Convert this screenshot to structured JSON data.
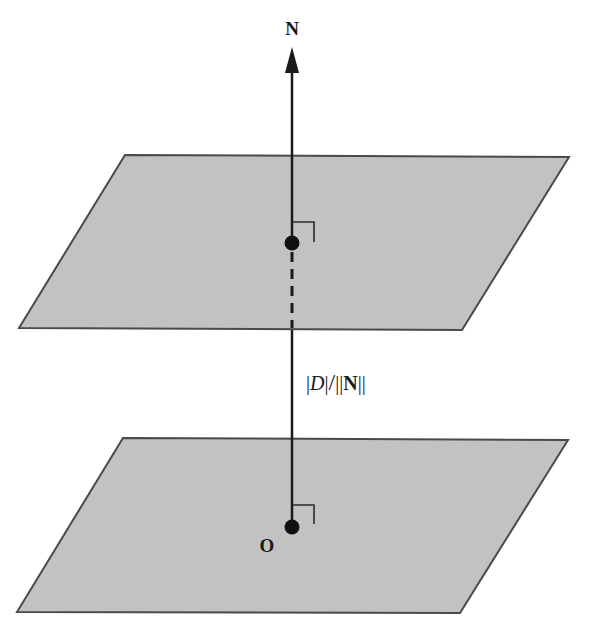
{
  "diagram": {
    "title": "",
    "colors": {
      "plane_fill": "#c2c2c2",
      "plane_stroke": "#4a4a4a",
      "line": "#1a1a1a",
      "background": "#ffffff"
    },
    "labels": {
      "normal": "N",
      "origin": "O",
      "distance_bar1": "|",
      "distance_D": "D",
      "distance_bar2": "|",
      "distance_slash": "/",
      "distance_bars3": "||",
      "distance_N": "N",
      "distance_bars4": "||"
    },
    "planes": [
      {
        "name": "upper-plane",
        "points": "125,155 569,157 462,330 19,328"
      },
      {
        "name": "lower-plane",
        "points": "123,438 568,440 460,613 17,612"
      }
    ],
    "points": [
      {
        "name": "upper-intersection-point",
        "x": 292,
        "y": 243
      },
      {
        "name": "origin-point",
        "x": 292,
        "y": 527
      }
    ]
  }
}
